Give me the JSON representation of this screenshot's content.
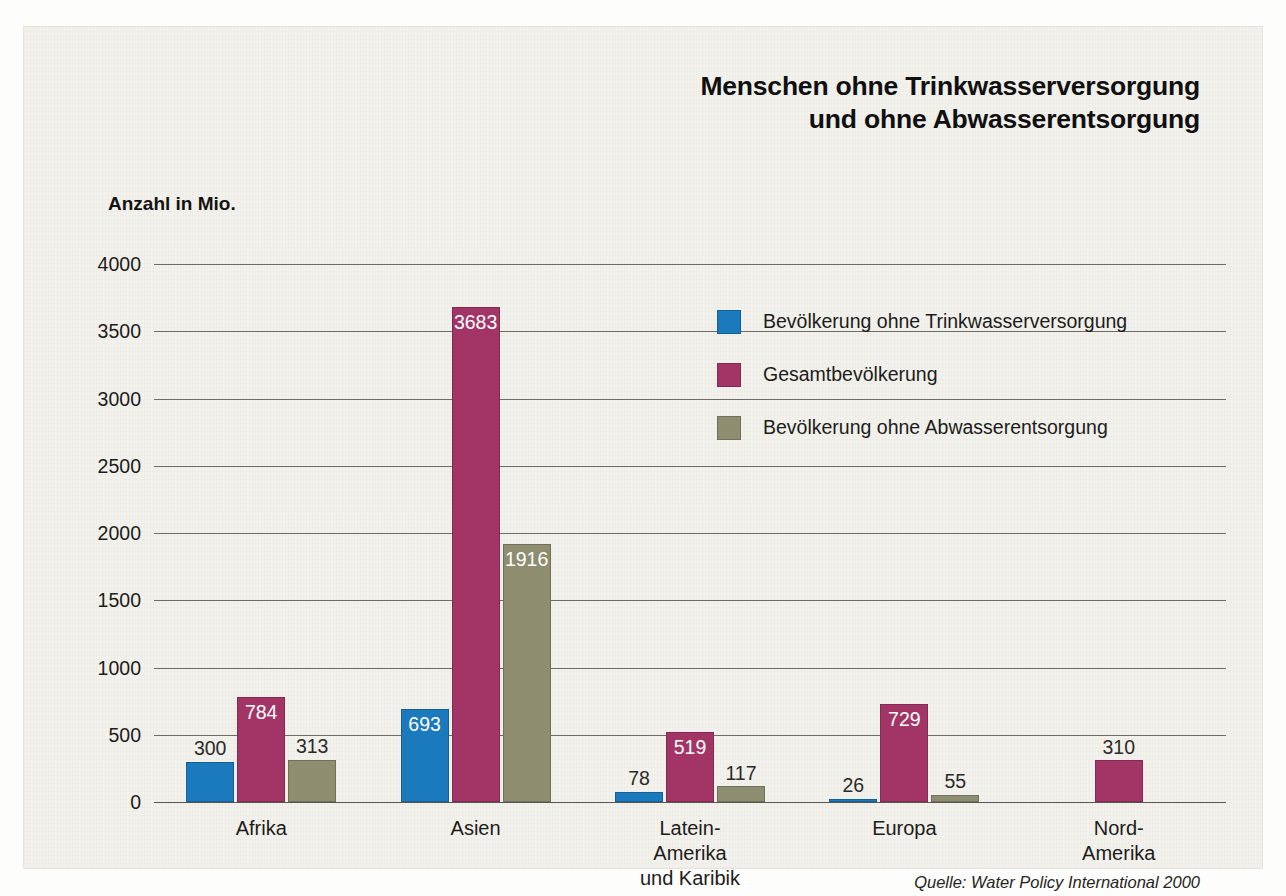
{
  "title": {
    "line1": "Menschen ohne Trinkwasserversorgung",
    "line2": "und ohne Abwasserentsorgung"
  },
  "axis": {
    "y_caption": "Anzahl in Mio."
  },
  "source": "Quelle: Water Policy International 2000",
  "legend": [
    {
      "label": "Bevölkerung ohne Trinkwasserversorgung",
      "color": "#1b79bd",
      "key": "blue"
    },
    {
      "label": "Gesamtbevölkerung",
      "color": "#a23566",
      "key": "magenta"
    },
    {
      "label": "Bevölkerung ohne Abwasserentsorgung",
      "color": "#8e8d70",
      "key": "olive"
    }
  ],
  "chart_data": {
    "type": "bar",
    "title": "Menschen ohne Trinkwasserversorgung und ohne Abwasserentsorgung",
    "xlabel": "",
    "ylabel": "Anzahl in Mio.",
    "ylim": [
      0,
      4000
    ],
    "yticks": [
      0,
      500,
      1000,
      1500,
      2000,
      2500,
      3000,
      3500,
      4000
    ],
    "ytick_labels": [
      "0",
      "500",
      "1000",
      "1500",
      "2000",
      "2500",
      "3000",
      "3500",
      "4000"
    ],
    "grid": true,
    "legend_position": "upper right inside",
    "categories": [
      "Afrika",
      "Asien",
      "Latein-Amerika\nund Karibik",
      "Europa",
      "Nord-Amerika"
    ],
    "series": [
      {
        "name": "Bevölkerung ohne Trinkwasserversorgung",
        "color": "#1b79bd",
        "values": [
          300,
          693,
          78,
          26,
          null
        ]
      },
      {
        "name": "Gesamtbevölkerung",
        "color": "#a23566",
        "values": [
          784,
          3683,
          519,
          729,
          310
        ]
      },
      {
        "name": "Bevölkerung ohne Abwasserentsorgung",
        "color": "#8e8d70",
        "values": [
          313,
          1916,
          117,
          55,
          null
        ]
      }
    ],
    "data_labels": [
      {
        "category": "Afrika",
        "series": "Bevölkerung ohne Trinkwasserversorgung",
        "value": 300,
        "text": "300"
      },
      {
        "category": "Afrika",
        "series": "Gesamtbevölkerung",
        "value": 784,
        "text": "784"
      },
      {
        "category": "Afrika",
        "series": "Bevölkerung ohne Abwasserentsorgung",
        "value": 313,
        "text": "313"
      },
      {
        "category": "Asien",
        "series": "Bevölkerung ohne Trinkwasserversorgung",
        "value": 693,
        "text": "693"
      },
      {
        "category": "Asien",
        "series": "Gesamtbevölkerung",
        "value": 3683,
        "text": "3683"
      },
      {
        "category": "Asien",
        "series": "Bevölkerung ohne Abwasserentsorgung",
        "value": 1916,
        "text": "1916"
      },
      {
        "category": "Latein-Amerika und Karibik",
        "series": "Bevölkerung ohne Trinkwasserversorgung",
        "value": 78,
        "text": "78"
      },
      {
        "category": "Latein-Amerika und Karibik",
        "series": "Gesamtbevölkerung",
        "value": 519,
        "text": "519"
      },
      {
        "category": "Latein-Amerika und Karibik",
        "series": "Bevölkerung ohne Abwasserentsorgung",
        "value": 117,
        "text": "117"
      },
      {
        "category": "Europa",
        "series": "Bevölkerung ohne Trinkwasserversorgung",
        "value": 26,
        "text": "26"
      },
      {
        "category": "Europa",
        "series": "Gesamtbevölkerung",
        "value": 729,
        "text": "729"
      },
      {
        "category": "Europa",
        "series": "Bevölkerung ohne Abwasserentsorgung",
        "value": 55,
        "text": "55"
      },
      {
        "category": "Nord-Amerika",
        "series": "Gesamtbevölkerung",
        "value": 310,
        "text": "310"
      }
    ]
  },
  "background_text": {
    "col1": "Die Europäische Union und ihre Mitglied-\nstaaten haben sich verpflichtet, die Hilfe\nfür die ärmsten Länder deutlich zu er-\nhöhen. Das Ziel von 0,7 Prozent des Brut-\ntoinlandsprodukts ist bis heute nur von\nwenigen Staaten erreicht worden. Die\nNiederlande, Dänemark, Schweden, Nor-\nwegen und Luxemburg überschreiten die\nvereinbarte Marke. Deutschland liegt mit\netwa 0,27 Prozent deutlich darunter und\nhat sich verpflichtet, den Anteil schritt-\nweise anzuheben. Die Entwicklung der\nöffentlichen Entwicklungszusammen-\narbeit ist seit Jahren rückläufig, während\nprivate Kapitalströme zunehmen.",
    "col2": "Von besonderer Bedeutung sind die Inve-\nstitionen in die Infrastruktur der Wasser-\nversorgung. Nach Schätzungen der Welt-\nbank müssten jährlich etwa 30 Milliarden\nUS-Dollar investiert werden, um die Ziele\nder Vereinten Nationen zu erreichen. Ge-\ngenwärtig liegen die Aufwendungen deut-\nlich darunter. Die Folgen sind in vielen\nRegionen sichtbar: verschmutztes Trink-\nwasser, fehlende Abwassersysteme und\neine hohe Zahl vermeidbarer Erkrankun-\ngen, vor allem bei Kindern unter fünf\nJahren. Die Weltgesundheitsorganisation\nschätzt die Zahl der jährlichen Todesfälle\nauf mehrere Millionen Menschen.",
    "col3": "Entscheidend ist der Aufbau tragfähiger\nStrukturen vor Ort. Nur wenn die Bevölke-\nrung an Planung und Betrieb beteiligt\nwird, lassen sich Anlagen dauerhaft be-\ntreiben. Erfahrungen aus zahlreichen\nProjekten zeigen, dass technische Lösun-\ngen allein nicht ausreichen. Ausbildung,\nWartung und eine verlässliche Finanzie-\nrung sind ebenso notwendig wie der poli-\ntische Wille, Wasser als öffentliches Gut\nzu behandeln und den Zugang für alle zu\nsichern. Die Diskussion über Privatisie-\nrung der Wasserversorgung wird daher in\nvielen Ländern kontrovers geführt und ist\nnoch keineswegs abgeschlossen."
  }
}
